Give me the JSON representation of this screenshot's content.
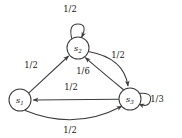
{
  "figure": {
    "type": "markov-chain-state-diagram",
    "background_color": "#ffffff",
    "stroke_color": "#3d3d3d",
    "text_color": "#1a1a1a"
  },
  "nodes": [
    {
      "id": "s1",
      "label": "s",
      "subscript": "1",
      "cx": 20,
      "cy": 100,
      "r": 11
    },
    {
      "id": "s2",
      "label": "s",
      "subscript": "2",
      "cx": 78,
      "cy": 48,
      "r": 11
    },
    {
      "id": "s3",
      "label": "s",
      "subscript": "3",
      "cx": 130,
      "cy": 99,
      "r": 11
    }
  ],
  "edges": [
    {
      "id": "s2-self",
      "from": "s2",
      "to": "s2",
      "label": "1/2",
      "label_x": 70,
      "label_y": 12
    },
    {
      "id": "s1-to-s2",
      "from": "s1",
      "to": "s2",
      "label": "1/2",
      "label_x": 31,
      "label_y": 68
    },
    {
      "id": "s2-to-s3",
      "from": "s2",
      "to": "s3",
      "label": "1/2",
      "label_x": 118,
      "label_y": 58
    },
    {
      "id": "s3-to-s2",
      "from": "s3",
      "to": "s2",
      "label": "1/6",
      "label_x": 83,
      "label_y": 74
    },
    {
      "id": "s3-to-s1",
      "from": "s3",
      "to": "s1",
      "label": "1/2",
      "label_x": 71,
      "label_y": 90
    },
    {
      "id": "s1-to-s3",
      "from": "s1",
      "to": "s3",
      "label": "1/2",
      "label_x": 70,
      "label_y": 133
    },
    {
      "id": "s3-self",
      "from": "s3",
      "to": "s3",
      "label": "1/3",
      "label_x": 157,
      "label_y": 102
    }
  ]
}
